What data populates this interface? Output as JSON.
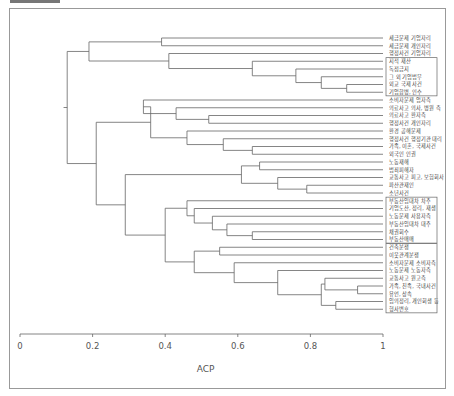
{
  "chart_data": {
    "type": "dendrogram",
    "title": "",
    "xlabel": "ACP",
    "ylabel": "",
    "xlim": [
      0,
      1
    ],
    "x_ticks": [
      "0",
      "0.2",
      "0.4",
      "0.6",
      "0.8",
      "1"
    ],
    "grid": false,
    "leaves": [
      "세금문제 기업자리",
      "세금문제 개인자리",
      "행정사건 기업자리",
      "지적 재산",
      "독점금지",
      "그 외 기업법무",
      "외교 국제 사건",
      "기업합병, 인수",
      "소비자문제 업자측",
      "의료사고 의사, 병원 측",
      "의료사고 환자측",
      "행정사건 개인자리",
      "환경 공해문제",
      "행정사건 행정기관 대리",
      "가족, 이혼, 국제사건",
      "외국인 인권",
      "노동재해",
      "범죄피해자",
      "교통사고 피고, 보험회사",
      "파산관재인",
      "소년사건",
      "부동산임대차 차주",
      "기업도산, 정리, 재생",
      "노동문제 사용자측",
      "부동산임대차 대주",
      "채권회수",
      "부동산매매",
      "건축분쟁",
      "이웃관계분쟁",
      "소비자문제 소비자측",
      "노동문제 노동자측",
      "교통사고 원고측",
      "가족, 친족, 국내사건",
      "유언, 상속",
      "임의정리, 개인회생 등",
      "형사변호"
    ],
    "boxed_groups": [
      [
        "지적 재산",
        "독점금지",
        "그 외 기업법무",
        "외교 국제 사건",
        "기업합병, 인수"
      ],
      [
        "부동산임대차 차주",
        "기업도산, 정리, 재생",
        "노동문제 사용자측",
        "부동산임대차 대주",
        "채권회수",
        "부동산매매"
      ],
      [
        "건축분쟁",
        "이웃관계분쟁",
        "소비자문제 소비자측",
        "노동문제 노동자측",
        "교통사고 원고측",
        "가족, 친족, 국내사건",
        "유언, 상속",
        "임의정리, 개인회생 등",
        "형사변호"
      ]
    ],
    "merge_heights_approx": [
      0.13,
      0.19,
      0.37,
      0.17,
      0.36,
      0.65,
      0.21,
      0.33,
      0.39,
      0.28,
      0.45,
      0.5
    ]
  }
}
